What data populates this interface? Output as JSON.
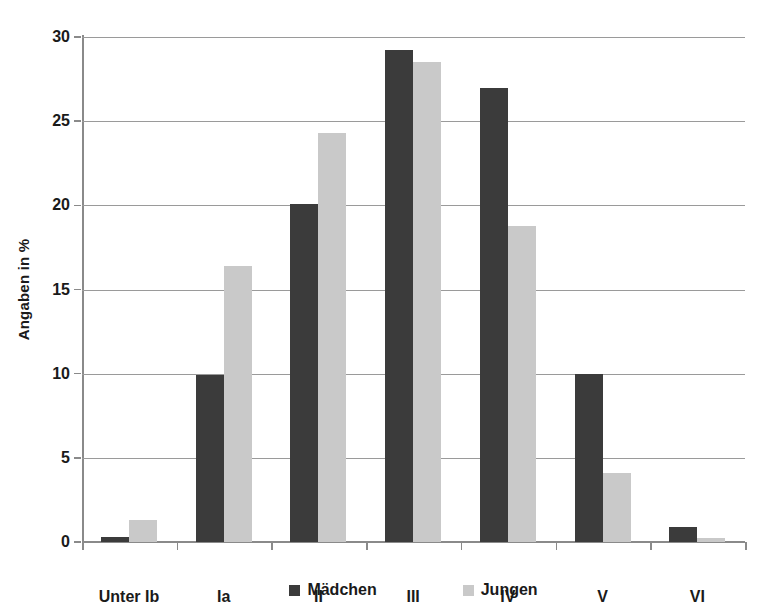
{
  "chart_data": {
    "type": "bar",
    "title": "",
    "subtitle": "",
    "xlabel": "",
    "ylabel": "Angaben in %",
    "categories": [
      "Unter Ib",
      "Ia",
      "II",
      "III",
      "IV",
      "V",
      "VI"
    ],
    "series": [
      {
        "name": "Mädchen",
        "color": "#3b3b3b",
        "values": [
          0.3,
          9.9,
          20.1,
          29.2,
          27.0,
          10.0,
          0.9
        ]
      },
      {
        "name": "Jungen",
        "color": "#c9c9c9",
        "values": [
          1.3,
          16.4,
          24.3,
          28.5,
          18.8,
          4.1,
          0.25
        ]
      }
    ],
    "ylim": [
      0,
      30
    ],
    "y_ticks": [
      0,
      5,
      10,
      15,
      20,
      25,
      30
    ],
    "y_tick_labels": [
      "0",
      "5",
      "10",
      "15",
      "20",
      "25",
      "30"
    ],
    "grid": "horizontal",
    "legend_position": "bottom-center",
    "background_color": "#ffffff",
    "axis_color": "#8a8a8a",
    "gridline_color": "#9a9a9a"
  }
}
